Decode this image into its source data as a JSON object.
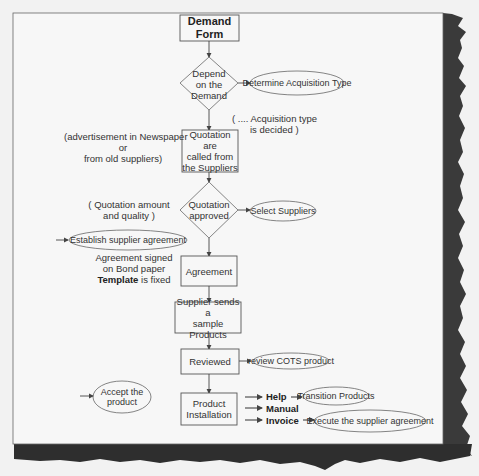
{
  "diagram": {
    "type": "flowchart",
    "colors": {
      "paper": "#f7f7f7",
      "background": "#f2f2f2",
      "shadow": "#2a2a2a",
      "stroke": "#555555",
      "text": "#333333"
    },
    "nodes": {
      "demand_form": {
        "shape": "rect",
        "label_line1": "Demand",
        "label_line2": "Form"
      },
      "depend_decision": {
        "shape": "diamond",
        "label_line1": "Depend",
        "label_line2": "on the",
        "label_line3": "Demand"
      },
      "quotation_called": {
        "shape": "rect",
        "label_line1": "Quotation are",
        "label_line2": "called from",
        "label_line3": "the Suppliers"
      },
      "quotation_approved": {
        "shape": "diamond",
        "label_line1": "Quotation",
        "label_line2": "approved"
      },
      "agreement": {
        "shape": "rect",
        "label": "Agreement"
      },
      "supplier_sample": {
        "shape": "rect",
        "label_line1": "Supplier sends a",
        "label_line2": "sample Products"
      },
      "reviewed": {
        "shape": "rect",
        "label": "Reviewed"
      },
      "product_installation": {
        "shape": "rect",
        "label_line1": "Product",
        "label_line2": "Installation"
      }
    },
    "ellipses": {
      "determine_acquisition": "Determine Acquisition Type",
      "select_suppliers": "Select Suppliers",
      "establish_agreement": "Establish supplier agreement",
      "review_cots": "review COTS product",
      "accept_product_line1": "Accept the",
      "accept_product_line2": "product",
      "transition_products": "Transition Products",
      "execute_agreement": "Execute the supplier agreement"
    },
    "annotations": {
      "acquisition_decided_line1": "( .... Acquisition type",
      "acquisition_decided_line2": "is decided )",
      "advertisement_line1": "(advertisement in Newspaper",
      "advertisement_line2": "or",
      "advertisement_line3": "from old suppliers)",
      "quotation_amount_line1": "( Quotation amount",
      "quotation_amount_line2": "and quality )",
      "agreement_signed_line1": "Agreement signed",
      "agreement_signed_line2": "on Bond paper",
      "template_bold": "Template",
      "template_rest": " is fixed"
    },
    "outputs": {
      "help": "Help",
      "manual": "Manual",
      "invoice": "Invoice"
    }
  }
}
